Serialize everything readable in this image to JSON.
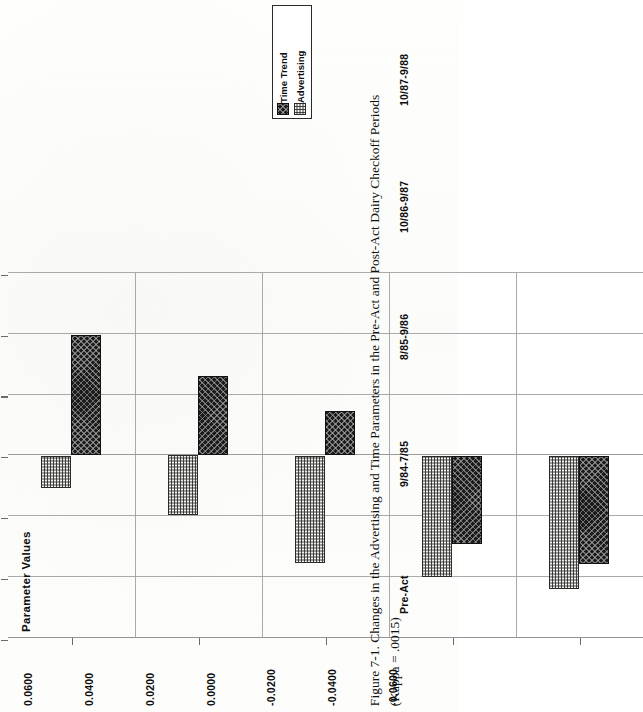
{
  "figure": {
    "caption_line1": "Figure 7-1.  Changes in the Advertising and Time Parameters in the Pre-Act and Post-Act Dairy Checkoff Periods",
    "caption_line2": "(Kappa = .0015)"
  },
  "legend": {
    "entries": [
      {
        "label": "Time Trend",
        "swatch": "dark-crosshatch-swatch",
        "color": "#1b1b1b"
      },
      {
        "label": "Advertising",
        "swatch": "light-stipple-swatch",
        "color": "#f1f1ee"
      }
    ]
  },
  "chart_data": {
    "type": "bar",
    "orientation": "horizontal",
    "title": "",
    "xlabel": "",
    "ylabel": "Parameter Values",
    "categories": [
      "Pre-Act",
      "9/84-7/85",
      "8/85-9/86",
      "10/86-9/87",
      "10/87-9/88"
    ],
    "series": [
      {
        "name": "Time Trend",
        "values": [
          -0.0395,
          -0.0262,
          -0.0145,
          0.0292,
          0.0358
        ]
      },
      {
        "name": "Advertising",
        "values": [
          0.0107,
          0.0195,
          0.0352,
          0.04,
          0.044
        ]
      }
    ],
    "ylim": [
      -0.06,
      0.06
    ],
    "ytick_labels": [
      "0.0600",
      "0.0400",
      "0.0200",
      "0.0000",
      "-0.0200",
      "-0.0400",
      "-0.0600"
    ],
    "ytick_values": [
      0.06,
      0.04,
      0.02,
      0.0,
      -0.02,
      -0.04,
      -0.06
    ],
    "grid": true,
    "legend_position": "top-right"
  }
}
